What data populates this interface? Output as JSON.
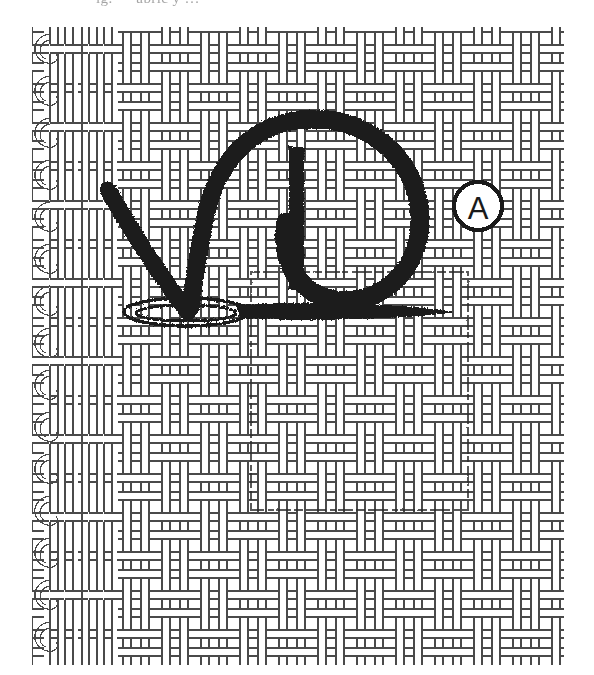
{
  "figure": {
    "kind": "technical-illustration",
    "caption_partial": "ig. — abric  y …",
    "background_color": "#ffffff",
    "yarn_color": "#4a4a4a",
    "yarn_shadow_color": "#8a8a8a",
    "ink_color": "#1a1a1a",
    "faint_ink_color": "#2b2b2b"
  },
  "fabric": {
    "name": "woven-fabric-swatch",
    "bounds": {
      "x": 32,
      "y": 27,
      "width": 532,
      "height": 638
    },
    "selvedge_side": "left",
    "selvedge_loop_count": 15,
    "warp_pitch_left_dense": 15,
    "warp_pitch_body": 39,
    "weft_pitch": 39,
    "weave": "basket"
  },
  "annotations": {
    "callout": {
      "name": "callout-a",
      "label": "A",
      "cx": 478,
      "cy": 206,
      "r": 24,
      "stroke_width": 4
    },
    "check_symbol": {
      "name": "surface-finish-check-mark",
      "description": "heavy hand-drawn check / tick with looped ellipse at the vertex",
      "vertex": {
        "x": 190,
        "y": 312
      }
    },
    "tick_bar": {
      "name": "vertical-tick-bar",
      "x": 296,
      "y_top": 146,
      "y_bottom": 292,
      "width": 15
    },
    "big_loop": {
      "name": "large-ink-loop",
      "cx": 318,
      "cy": 218,
      "rx": 100,
      "ry": 98
    },
    "ellipse_base": {
      "name": "flattened-ellipse-at-vertex",
      "cx": 186,
      "cy": 312,
      "rx": 62,
      "ry": 14
    },
    "pointer_line": {
      "name": "leader-line",
      "x1": 186,
      "y1": 312,
      "x2": 452,
      "y2": 316
    },
    "ghost_rectangle": {
      "name": "faint-traced-rectangle",
      "x": 251,
      "y": 272,
      "width": 217,
      "height": 238,
      "stroke_width": 2
    }
  },
  "legend": {
    "items": [
      {
        "key": "A",
        "meaning": "callout marker A"
      }
    ]
  }
}
